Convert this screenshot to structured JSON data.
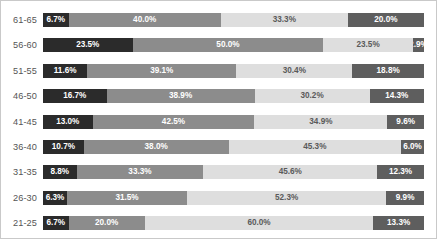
{
  "chart_data": {
    "type": "bar",
    "subtype": "horizontal-100-percent-stacked",
    "title": "",
    "subtitle": "",
    "xlabel": "",
    "ylabel": "",
    "xlim": [
      0,
      100
    ],
    "grid": false,
    "legend": "none",
    "categories": [
      "61-65",
      "56-60",
      "51-55",
      "46-50",
      "41-45",
      "36-40",
      "31-35",
      "26-30",
      "21-25"
    ],
    "series": [
      {
        "name": "Series 1",
        "color": "#2b2b2b",
        "text_color": "#ffffff",
        "values": [
          6.7,
          23.5,
          11.6,
          16.7,
          13.0,
          10.7,
          8.8,
          6.3,
          6.7
        ],
        "labels": [
          "6.7%",
          "23.5%",
          "11.6%",
          "16.7%",
          "13.0%",
          "10.7%",
          "8.8%",
          "6.3%",
          "6.7%"
        ]
      },
      {
        "name": "Series 2",
        "color": "#8c8c8c",
        "text_color": "#ffffff",
        "values": [
          40.0,
          50.0,
          39.1,
          38.9,
          42.5,
          38.0,
          33.3,
          31.5,
          20.0
        ],
        "labels": [
          "40.0%",
          "50.0%",
          "39.1%",
          "38.9%",
          "42.5%",
          "38.0%",
          "33.3%",
          "31.5%",
          "20.0%"
        ]
      },
      {
        "name": "Series 3",
        "color": "#dedede",
        "text_color": "#5a5a5a",
        "values": [
          33.3,
          23.5,
          30.4,
          30.2,
          34.9,
          45.3,
          45.6,
          52.3,
          60.0
        ],
        "labels": [
          "33.3%",
          "23.5%",
          "30.4%",
          "30.2%",
          "34.9%",
          "45.3%",
          "45.6%",
          "52.3%",
          "60.0%"
        ]
      },
      {
        "name": "Series 4",
        "color": "#5e5e5e",
        "text_color": "#ffffff",
        "values": [
          20.0,
          2.9,
          18.8,
          14.3,
          9.6,
          6.0,
          12.3,
          9.9,
          13.3
        ],
        "labels": [
          "20.0%",
          "2.9%",
          "18.8%",
          "14.3%",
          "9.6%",
          "6.0%",
          "12.3%",
          "9.9%",
          "13.3%"
        ]
      }
    ]
  },
  "style": {
    "background": "#ffffff",
    "border_color": "#c9c9c9",
    "label_color": "#555555"
  }
}
